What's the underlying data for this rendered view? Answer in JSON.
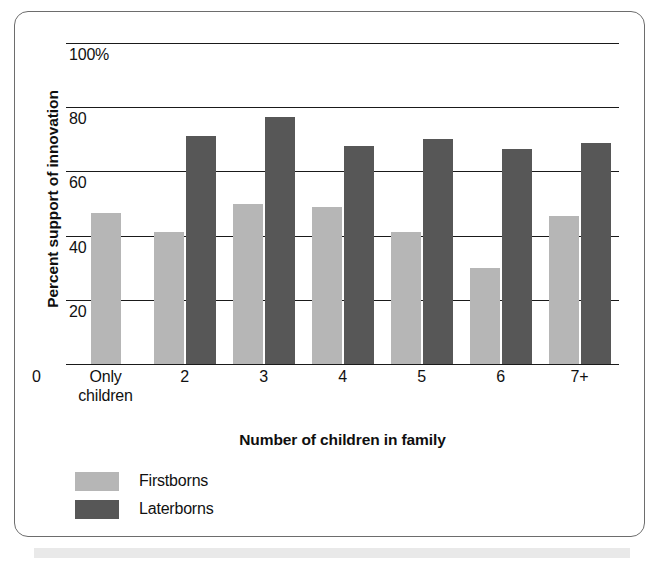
{
  "chart_data": {
    "type": "bar",
    "title": "",
    "xlabel": "Number of children in family",
    "ylabel": "Percent support of innovation",
    "categories": [
      "Only children",
      "2",
      "3",
      "4",
      "5",
      "6",
      "7+"
    ],
    "series": [
      {
        "name": "Firstborns",
        "color": "#b6b6b6",
        "values": [
          47,
          41,
          50,
          49,
          41,
          30,
          46
        ]
      },
      {
        "name": "Laterborns",
        "color": "#575757",
        "values": [
          null,
          71,
          77,
          68,
          70,
          67,
          69
        ]
      }
    ],
    "ylim": [
      0,
      100
    ],
    "yticks": [
      "0",
      "20",
      "40",
      "60",
      "80",
      "100%"
    ],
    "ytick_values": [
      0,
      20,
      40,
      60,
      80,
      100
    ],
    "grid": true,
    "legend_position": "bottom-left"
  },
  "axes": {
    "y_title": "Percent support of innovation",
    "x_title": "Number of children in family",
    "zero_label": "0"
  },
  "legend": {
    "items": [
      {
        "label": "Firstborns",
        "color": "#b6b6b6"
      },
      {
        "label": "Laterborns",
        "color": "#575757"
      }
    ]
  },
  "xtick_labels": [
    {
      "line1": "Only",
      "line2": "children"
    },
    {
      "line1": "2",
      "line2": ""
    },
    {
      "line1": "3",
      "line2": ""
    },
    {
      "line1": "4",
      "line2": ""
    },
    {
      "line1": "5",
      "line2": ""
    },
    {
      "line1": "6",
      "line2": ""
    },
    {
      "line1": "7+",
      "line2": ""
    }
  ]
}
